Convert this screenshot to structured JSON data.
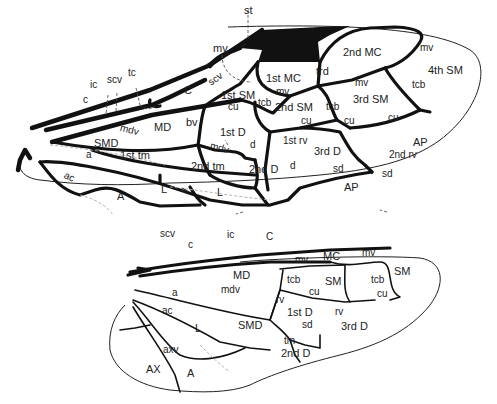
{
  "figure": {
    "forewing": {
      "labels": {
        "st": "st",
        "mv1": "mv",
        "scv1": "scv",
        "tc": "tc",
        "ic": "ic",
        "scv2": "scv",
        "c": "c",
        "C": "C",
        "MD": "MD",
        "mdv1": "mdv",
        "bv": "bv",
        "SMD": "SMD",
        "a": "a",
        "tm1": "1st tm",
        "ac": "ac",
        "A": "A",
        "L1": "L",
        "ll": "ll",
        "L2": "L",
        "MC1": "1st MC",
        "mv2": "mv",
        "trd": "trd",
        "MC2": "2nd MC",
        "mv3": "mv",
        "mv4": "mv",
        "SM1": "1st SM",
        "cu1": "cu",
        "tcb1": "tcb",
        "SM2": "2nd SM",
        "cu2": "cu",
        "tcb2": "tcb",
        "SM3": "3rd SM",
        "cu3": "cu",
        "cu4": "cu",
        "tcb3": "tcb",
        "SM4": "4th SM",
        "D1": "1st D",
        "mdv2": "mdv",
        "d1": "d",
        "rv1": "1st rv",
        "D3": "3rd D",
        "AP1": "AP",
        "rv2": "2nd rv",
        "tm2": "2nd tm",
        "D2": "2nd D",
        "d2": "d",
        "sd1": "sd",
        "sd2": "sd",
        "AP2": "AP"
      }
    },
    "hindwing": {
      "labels": {
        "scv": "scv",
        "c": "c",
        "ic": "ic",
        "C": "C",
        "mv1": "mv",
        "MC": "MC",
        "mv2": "mv",
        "SM1": "SM",
        "MD": "MD",
        "tcb1": "tcb",
        "SM2": "SM",
        "cu1": "cu",
        "tcb2": "tcb",
        "cu2": "cu",
        "a": "a",
        "mdv": "mdv",
        "rv1": "rv",
        "D1": "1st D",
        "rv2": "rv",
        "ac": "ac",
        "L": "L",
        "SMD": "SMD",
        "sd": "sd",
        "D3": "3rd D",
        "tm": "tm",
        "axv": "axv",
        "D2": "2nd D",
        "AX": "AX",
        "A": "A"
      }
    }
  }
}
